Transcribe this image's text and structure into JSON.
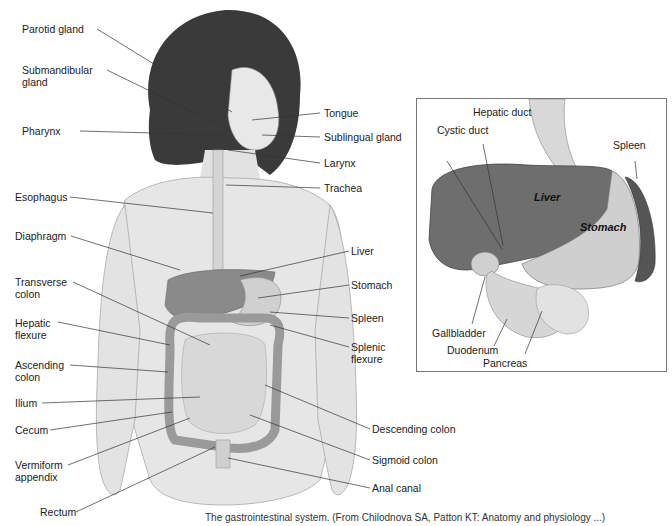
{
  "figure": {
    "caption": "The gastrointestinal system. (From Chilodnova SA, Patton KT: Anatomy and physiology ...)",
    "main_labels_left": [
      {
        "id": "parotid",
        "text": "Parotid gland"
      },
      {
        "id": "submandibular",
        "text": "Submandibular gland"
      },
      {
        "id": "pharynx",
        "text": "Pharynx"
      },
      {
        "id": "esophagus",
        "text": "Esophagus"
      },
      {
        "id": "diaphragm",
        "text": "Diaphragm"
      },
      {
        "id": "transverse",
        "text": "Transverse colon"
      },
      {
        "id": "hepatic_flexure",
        "text": "Hepatic flexure"
      },
      {
        "id": "ascending",
        "text": "Ascending colon"
      },
      {
        "id": "ilium",
        "text": "Ilium"
      },
      {
        "id": "cecum",
        "text": "Cecum"
      },
      {
        "id": "appendix",
        "text": "Vermiform appendix"
      },
      {
        "id": "rectum",
        "text": "Rectum"
      }
    ],
    "main_labels_right": [
      {
        "id": "tongue",
        "text": "Tongue"
      },
      {
        "id": "sublingual",
        "text": "Sublingual gland"
      },
      {
        "id": "larynx",
        "text": "Larynx"
      },
      {
        "id": "trachea",
        "text": "Trachea"
      },
      {
        "id": "liver",
        "text": "Liver"
      },
      {
        "id": "stomach",
        "text": "Stomach"
      },
      {
        "id": "spleen",
        "text": "Spleen"
      },
      {
        "id": "splenic_flexure",
        "text": "Splenic flexure"
      },
      {
        "id": "descending",
        "text": "Descending colon"
      },
      {
        "id": "sigmoid",
        "text": "Sigmoid colon"
      },
      {
        "id": "anal",
        "text": "Anal canal"
      }
    ],
    "inset": {
      "labels": [
        {
          "id": "cystic_duct",
          "text": "Cystic duct"
        },
        {
          "id": "hepatic_duct",
          "text": "Hepatic duct"
        },
        {
          "id": "spleen",
          "text": "Spleen"
        },
        {
          "id": "gallbladder",
          "text": "Gallbladder"
        },
        {
          "id": "duodenum",
          "text": "Duodenum"
        },
        {
          "id": "pancreas",
          "text": "Pancreas"
        }
      ],
      "organ_labels": {
        "liver": "Liver",
        "stomach": "Stomach"
      }
    },
    "colors": {
      "liver": "#6e6e6e",
      "stomach": "#cfcfcf",
      "spleen": "#5a5a5a",
      "skin": "#e6e6e6",
      "hair": "#3a3a3a",
      "line": "#333333"
    }
  }
}
